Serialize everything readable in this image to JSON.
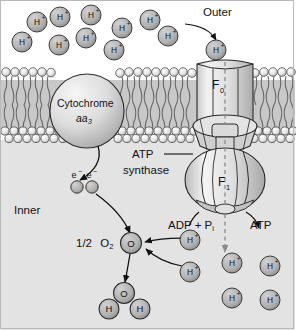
{
  "figure": {
    "type": "biology-diagram"
  },
  "colors": {
    "outer_background": "#ffffff",
    "inner_background": "#e3e3e3",
    "membrane_head": "#e9e9e9",
    "membrane_tail": "#8c8c8c",
    "proton_fill": "#b4b4b4",
    "protein_fill": "#dcdcdc",
    "outline": "#1a1a1a",
    "text": "#111111"
  },
  "labels": {
    "outer": "Outer",
    "inner": "Inner",
    "cytochrome_name": "Cytochrome",
    "cytochrome_subunit": "aa",
    "cytochrome_subunit_number": "3",
    "atp_synthase_line1": "ATP",
    "atp_synthase_line2": "synthase",
    "f0": "F",
    "f0_sub": "0",
    "f1": "F",
    "f1_sub": "1",
    "adp_pi": "ADP + P",
    "adp_pi_sub": "i",
    "atp": "ATP",
    "half_oxygen_coefficient": "1/2",
    "oxygen": "O",
    "oxygen_sub": "2"
  },
  "species": {
    "proton": "H+",
    "proton_text": "H",
    "proton_charge": "+",
    "electron": "e",
    "electron_charge": "−",
    "oxygen_atom": "O",
    "hydrogen_atom": "H"
  },
  "protons_outer": [
    {
      "x": 37,
      "y": 22
    },
    {
      "x": 60,
      "y": 17
    },
    {
      "x": 22,
      "y": 42
    },
    {
      "x": 59,
      "y": 45
    },
    {
      "x": 91,
      "y": 15
    },
    {
      "x": 86,
      "y": 38
    },
    {
      "x": 114,
      "y": 50
    },
    {
      "x": 122,
      "y": 28
    },
    {
      "x": 150,
      "y": 20
    },
    {
      "x": 168,
      "y": 36
    }
  ],
  "proton_entering_channel": {
    "x": 216,
    "y": 50,
    "label": "H+"
  },
  "protons_inner_right": [
    {
      "x": 232,
      "y": 263
    },
    {
      "x": 270,
      "y": 266
    },
    {
      "x": 232,
      "y": 298
    },
    {
      "x": 270,
      "y": 300
    }
  ],
  "protons_to_oxygen": [
    {
      "x": 190,
      "y": 240
    },
    {
      "x": 190,
      "y": 272
    }
  ],
  "electrons": [
    {
      "x": 77,
      "y": 187
    },
    {
      "x": 92,
      "y": 187
    }
  ],
  "oxygen_molecule": {
    "x": 131,
    "y": 243
  },
  "water": {
    "oxygen": {
      "x": 124,
      "y": 293
    },
    "hydrogens": [
      {
        "x": 109,
        "y": 309
      },
      {
        "x": 140,
        "y": 309
      }
    ]
  },
  "cytochrome": {
    "cx": 87,
    "cy": 111,
    "r": 37
  },
  "membrane": {
    "top": 68,
    "bottom": 143
  },
  "f0_channel": {
    "x": 196,
    "y": 60,
    "width": 56,
    "height": 62
  },
  "f1_head": {
    "cx": 225,
    "cy": 180,
    "rx": 40,
    "ry": 32
  }
}
